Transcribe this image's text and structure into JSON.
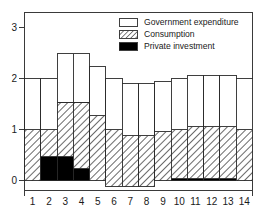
{
  "chart_data": {
    "type": "bar",
    "subtype": "stacked-bar",
    "title": "",
    "subtitle": "",
    "xlabel": "",
    "ylabel": "",
    "categories": [
      "1",
      "2",
      "3",
      "4",
      "5",
      "6",
      "7",
      "8",
      "9",
      "10",
      "11",
      "12",
      "13",
      "14"
    ],
    "series": [
      {
        "name": "Private investment",
        "key": "private_investment",
        "fill": "solid-black",
        "color": "#000000",
        "values": [
          0.0,
          0.47,
          0.47,
          0.23,
          0.0,
          0.0,
          0.0,
          0.0,
          0.0,
          0.03,
          0.03,
          0.03,
          0.03,
          0.0
        ]
      },
      {
        "name": "Consumption",
        "key": "consumption",
        "fill": "diagonal-hatch",
        "color": "#ffffff",
        "values": [
          1.0,
          0.53,
          1.06,
          1.3,
          1.27,
          1.12,
          1.0,
          1.0,
          0.96,
          0.97,
          1.02,
          1.02,
          1.02,
          1.0
        ]
      },
      {
        "name": "Government expenditure",
        "key": "government_expenditure",
        "fill": "empty-white",
        "color": "#ffffff",
        "values": [
          1.0,
          1.0,
          0.97,
          0.97,
          0.96,
          1.0,
          1.02,
          1.02,
          0.99,
          1.0,
          1.0,
          1.0,
          1.0,
          1.0
        ]
      }
    ],
    "segment_tops": {
      "investment_top": [
        0.0,
        0.47,
        0.47,
        0.23,
        0.0,
        -0.12,
        -0.12,
        -0.12,
        0.0,
        0.03,
        0.03,
        0.03,
        0.03,
        0.0
      ],
      "consumption_top": [
        1.0,
        1.0,
        1.53,
        1.53,
        1.27,
        1.0,
        0.88,
        0.88,
        0.96,
        1.0,
        1.05,
        1.05,
        1.05,
        1.0
      ],
      "bar_top": [
        2.0,
        2.0,
        2.5,
        2.5,
        2.23,
        2.0,
        1.9,
        1.9,
        1.95,
        2.0,
        2.05,
        2.05,
        2.05,
        2.0
      ]
    },
    "bar_baselines": [
      0.0,
      0.0,
      0.0,
      0.0,
      0.0,
      -0.12,
      -0.12,
      -0.12,
      0.0,
      0.0,
      0.0,
      0.0,
      0.0,
      0.0
    ],
    "totals": [
      2.0,
      2.0,
      2.5,
      2.5,
      2.23,
      2.0,
      1.9,
      1.9,
      1.95,
      2.0,
      2.05,
      2.05,
      2.05,
      2.0
    ],
    "ylim": [
      -0.25,
      3.0
    ],
    "yticks": [
      0,
      1,
      2,
      3
    ],
    "ytick_labels": [
      "0",
      "1",
      "2",
      "3"
    ],
    "xtick_labels": [
      "1",
      "2",
      "3",
      "4",
      "5",
      "6",
      "7",
      "8",
      "9",
      "10",
      "11",
      "12",
      "13",
      "14"
    ],
    "grid": false,
    "legend_position": "top-right",
    "legend_entries": [
      {
        "label": "Government expenditure",
        "swatch": "empty-white"
      },
      {
        "label": "Consumption",
        "swatch": "diagonal-hatch"
      },
      {
        "label": "Private investment",
        "swatch": "solid-black"
      }
    ]
  },
  "legend": {
    "items": [
      {
        "label": "Government expenditure"
      },
      {
        "label": "Consumption"
      },
      {
        "label": "Private investment"
      }
    ]
  },
  "axes": {
    "y_ticks": [
      "0",
      "1",
      "2",
      "3"
    ],
    "x_ticks": [
      "1",
      "2",
      "3",
      "4",
      "5",
      "6",
      "7",
      "8",
      "9",
      "10",
      "11",
      "12",
      "13",
      "14"
    ]
  }
}
